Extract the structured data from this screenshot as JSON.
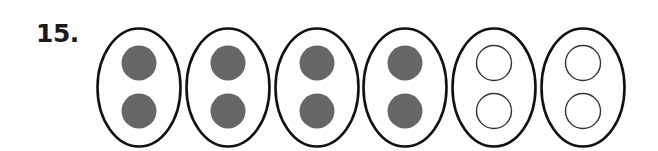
{
  "problem": {
    "number_label": "15."
  },
  "figure": {
    "groups": [
      {
        "cx": 139,
        "filled": true
      },
      {
        "cx": 228,
        "filled": true
      },
      {
        "cx": 317,
        "filled": true
      },
      {
        "cx": 405,
        "filled": true
      },
      {
        "cx": 494,
        "filled": false
      },
      {
        "cx": 583,
        "filled": false
      }
    ],
    "counters_per_group": 2,
    "total_groups": 6,
    "filled_groups": 4,
    "empty_groups": 2
  },
  "colors": {
    "oval_stroke": "#111111",
    "filled_counter": "#666666",
    "empty_counter_stroke": "#333333",
    "background": "#ffffff"
  }
}
